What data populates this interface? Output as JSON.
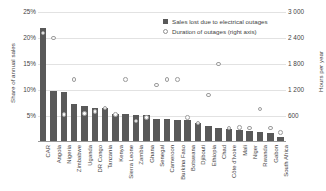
{
  "chart_data": {
    "type": "bar",
    "title": "",
    "xlabel": "",
    "ylabel": "Share of annual sales",
    "ylabel_right": "Hours per year",
    "ylim": [
      0,
      25
    ],
    "ylim_right": [
      0,
      3000
    ],
    "grid": true,
    "legend_position": "top-right",
    "categories": [
      "CAR",
      "Angola",
      "Nigeria",
      "Zimbabwe",
      "Uganda",
      "DR Congo",
      "Tanzania",
      "Kenya",
      "Sierra Leone",
      "Zambia",
      "Ghana",
      "Senegal",
      "Cameroon",
      "Burkina Faso",
      "Botswana",
      "Djibouti",
      "Ethiopia",
      "Chad",
      "Côte d'Ivoire",
      "Mali",
      "Niger",
      "Rwanda",
      "Gabon",
      "South Africa"
    ],
    "series": [
      {
        "name": "Sales lost due to electrical outages",
        "axis": "left",
        "unit": "%",
        "type": "bar",
        "color": "#595959",
        "values": [
          22.0,
          9.8,
          9.6,
          7.3,
          7.0,
          6.6,
          6.5,
          5.3,
          5.3,
          5.2,
          5.1,
          4.4,
          4.4,
          4.3,
          4.3,
          3.6,
          3.1,
          2.7,
          2.5,
          2.3,
          2.1,
          1.9,
          1.7,
          1.0
        ]
      },
      {
        "name": "Duration of outages (right axis)",
        "axis": "right",
        "unit": "hours per year",
        "type": "scatter",
        "color": "#9d9d9d",
        "values": [
          2520,
          2400,
          640,
          1440,
          660,
          700,
          780,
          640,
          1440,
          480,
          560,
          1320,
          1440,
          1440,
          560,
          440,
          1080,
          1800,
          320,
          340,
          320,
          760,
          320,
          220
        ]
      }
    ],
    "yticks_left": [
      "25%",
      "20%",
      "15%",
      "10%",
      "5%"
    ],
    "ytick_values_left": [
      25,
      20,
      15,
      10,
      5
    ],
    "yticks_right": [
      "3 000",
      "2 400",
      "1 800",
      "1 200",
      "600"
    ],
    "ytick_values_right": [
      3000,
      2400,
      1800,
      1200,
      600
    ],
    "legend": [
      {
        "label": "Sales lost due to electrical outages",
        "marker": "filled-square"
      },
      {
        "label": "Duration of outages (right axis)",
        "marker": "hollow-circle"
      }
    ]
  }
}
